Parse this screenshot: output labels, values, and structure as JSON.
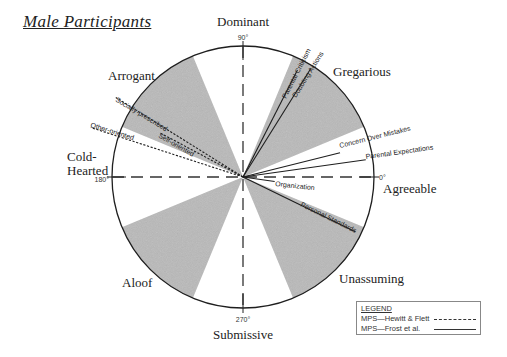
{
  "title": "Male Participants",
  "colors": {
    "shade": "#b9b9b9",
    "ink": "#1e1e1e",
    "background": "#ffffff"
  },
  "circle": {
    "cx": 243,
    "cy": 177,
    "r": 131
  },
  "axes": {
    "deg_0": "0°",
    "deg_90": "90°",
    "deg_180": "180°",
    "deg_270": "270°"
  },
  "octant_labels": {
    "dominant": "Dominant",
    "gregarious": "Gregarious",
    "agreeable": "Agreeable",
    "unassuming": "Unassuming",
    "submissive": "Submissive",
    "aloof": "Aloof",
    "cold_hearted_line1": "Cold-",
    "cold_hearted_line2": "Hearted",
    "arrogant": "Arrogant"
  },
  "shaded_wedges": [
    {
      "name": "Gregarious",
      "start_deg": 22.5,
      "end_deg": 67.5
    },
    {
      "name": "Arrogant",
      "start_deg": 112.5,
      "end_deg": 157.5
    },
    {
      "name": "Aloof",
      "start_deg": 202.5,
      "end_deg": 247.5
    },
    {
      "name": "Unassuming",
      "start_deg": 292.5,
      "end_deg": 337.5
    }
  ],
  "vectors": {
    "frost": [
      {
        "label": "Parental Criticism",
        "angle_deg": 63,
        "length": 120
      },
      {
        "label": "Doubting Actions",
        "angle_deg": 58,
        "length": 128
      },
      {
        "label": "Concern Over Mistakes",
        "angle_deg": 14,
        "length": 100
      },
      {
        "label": "Parental Expectations",
        "angle_deg": 8,
        "length": 124
      },
      {
        "label": "Organization",
        "angle_deg": -8,
        "length": 32
      },
      {
        "label": "Personal Standards",
        "angle_deg": -26,
        "length": 125
      }
    ],
    "hewitt_flett": [
      {
        "label": "Socially-prescribed",
        "angle_deg": 148,
        "length": 150
      },
      {
        "label": "Self-oriented",
        "angle_deg": 152,
        "length": 95
      },
      {
        "label": "Other-oriented",
        "angle_deg": 162,
        "length": 160
      }
    ]
  },
  "legend": {
    "title": "LEGEND",
    "rows": [
      {
        "label": "MPS—Hewitt & Flett",
        "style": "dashed"
      },
      {
        "label": "MPS—Frost et al.",
        "style": "solid"
      }
    ]
  }
}
